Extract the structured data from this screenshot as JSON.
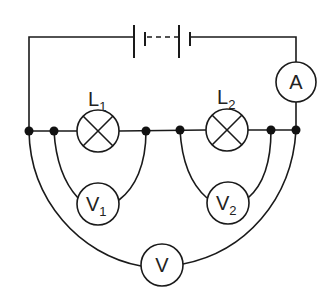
{
  "diagram": {
    "type": "circuit",
    "components": {
      "battery": {
        "label": "",
        "kind": "battery of cells (multi-cell)"
      },
      "ammeter": {
        "symbol": "A",
        "kind": "ammeter"
      },
      "lamp1": {
        "label": "L",
        "subscript": "1",
        "kind": "lamp"
      },
      "lamp2": {
        "label": "L",
        "subscript": "2",
        "kind": "lamp"
      },
      "voltmeter1": {
        "symbol": "V",
        "subscript": "1",
        "kind": "voltmeter",
        "across": "lamp1"
      },
      "voltmeter2": {
        "symbol": "V",
        "subscript": "2",
        "kind": "voltmeter",
        "across": "lamp2"
      },
      "voltmeter_total": {
        "symbol": "V",
        "subscript": "",
        "kind": "voltmeter",
        "across": "lamp1 + lamp2"
      }
    },
    "colors": {
      "line": "#1a1a1a",
      "background": "#ffffff"
    }
  }
}
